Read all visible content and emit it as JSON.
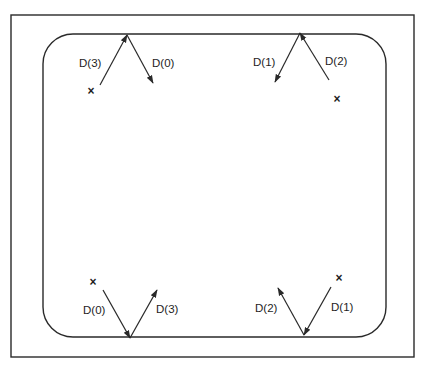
{
  "diagram": {
    "outer_frame": {
      "x": 11,
      "y": 15,
      "width": 403,
      "height": 342
    },
    "region": {
      "x": 43,
      "y": 34,
      "width": 343,
      "height": 303,
      "corner_radius": 30
    },
    "stroke_color": "#2a2a2a",
    "groups": [
      {
        "name": "top-left",
        "apex": [
          127,
          35
        ],
        "point_label": "×",
        "point": [
          91,
          95
        ],
        "vectors": [
          {
            "label": "D(3)",
            "from": [
              100,
              85
            ],
            "to": [
              127,
              35
            ],
            "label_pos": [
              79,
              67
            ]
          },
          {
            "label": "D(0)",
            "from": [
              127,
              35
            ],
            "to": [
              153,
              83
            ],
            "label_pos": [
              152,
              67
            ]
          }
        ]
      },
      {
        "name": "top-right",
        "apex": [
          300,
          33
        ],
        "point_label": "×",
        "point": [
          337,
          103
        ],
        "vectors": [
          {
            "label": "D(1)",
            "from": [
              300,
              33
            ],
            "to": [
              275,
              82
            ],
            "label_pos": [
              253,
              66
            ]
          },
          {
            "label": "D(2)",
            "from": [
              329,
              80
            ],
            "to": [
              300,
              33
            ],
            "label_pos": [
              325,
              65
            ]
          }
        ]
      },
      {
        "name": "bottom-left",
        "apex": [
          130,
          338
        ],
        "point_label": "×",
        "point": [
          93,
          286
        ],
        "vectors": [
          {
            "label": "D(0)",
            "from": [
              103,
              290
            ],
            "to": [
              130,
              338
            ],
            "label_pos": [
              83,
              314
            ]
          },
          {
            "label": "D(3)",
            "from": [
              130,
              338
            ],
            "to": [
              157,
              290
            ],
            "label_pos": [
              156,
              313
            ]
          }
        ]
      },
      {
        "name": "bottom-right",
        "apex": [
          304,
          335
        ],
        "point_label": "×",
        "point": [
          339,
          282
        ],
        "vectors": [
          {
            "label": "D(2)",
            "from": [
              304,
              335
            ],
            "to": [
              278,
              288
            ],
            "label_pos": [
              255,
              312
            ]
          },
          {
            "label": "D(1)",
            "from": [
              331,
              287
            ],
            "to": [
              304,
              335
            ],
            "label_pos": [
              331,
              311
            ]
          }
        ]
      }
    ]
  }
}
